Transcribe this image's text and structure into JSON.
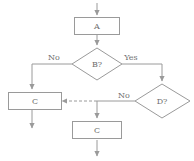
{
  "diagram": {
    "canvas": {
      "width": 194,
      "height": 161,
      "background": "#ffffff"
    },
    "colors": {
      "stroke": "#9a9a9a",
      "text": "#6e6e6e",
      "fill": "#ffffff"
    },
    "nodes": [
      {
        "id": "a",
        "type": "process",
        "label": "A",
        "x": 97,
        "y": 26,
        "w": 46,
        "h": 18
      },
      {
        "id": "b",
        "type": "decision",
        "label": "B?",
        "x": 97,
        "y": 64,
        "w": 50,
        "h": 32
      },
      {
        "id": "c_left",
        "type": "process",
        "label": "C",
        "x": 32,
        "y": 101,
        "w": 47,
        "h": 18
      },
      {
        "id": "d",
        "type": "decision",
        "label": "D?",
        "x": 162,
        "y": 102,
        "w": 55,
        "h": 35
      },
      {
        "id": "c_bottom",
        "type": "process",
        "label": "C",
        "x": 97,
        "y": 131,
        "w": 50,
        "h": 18
      }
    ],
    "edge_labels": [
      {
        "id": "b_no",
        "text": "No",
        "x": 54,
        "y": 58
      },
      {
        "id": "b_yes",
        "text": "Yes",
        "x": 131,
        "y": 58
      },
      {
        "id": "d_no",
        "text": "No",
        "x": 124,
        "y": 97
      }
    ],
    "edges": [
      {
        "id": "entry-to-a",
        "from": "entry",
        "to": "a",
        "style": "solid",
        "arrow": true
      },
      {
        "id": "a-to-b",
        "from": "a",
        "to": "b",
        "style": "solid",
        "arrow": true
      },
      {
        "id": "b-no-to-c-left",
        "from": "b",
        "to": "c_left",
        "label": "No",
        "style": "solid",
        "arrow": true
      },
      {
        "id": "b-yes-to-d",
        "from": "b",
        "to": "d",
        "label": "Yes",
        "style": "solid",
        "arrow": true
      },
      {
        "id": "d-no-to-junction",
        "from": "d",
        "to": "junction",
        "label": "No",
        "style": "solid",
        "arrow": false
      },
      {
        "id": "junction-to-c-left",
        "from": "junction",
        "to": "c_left",
        "style": "dashed",
        "arrow": true
      },
      {
        "id": "junction-to-c-bottom",
        "from": "junction",
        "to": "c_bottom",
        "style": "solid",
        "arrow": true
      },
      {
        "id": "c-left-exit",
        "from": "c_left",
        "to": "exit",
        "style": "solid",
        "arrow": true
      },
      {
        "id": "c-bottom-exit",
        "from": "c_bottom",
        "to": "exit",
        "style": "solid",
        "arrow": true
      }
    ]
  }
}
